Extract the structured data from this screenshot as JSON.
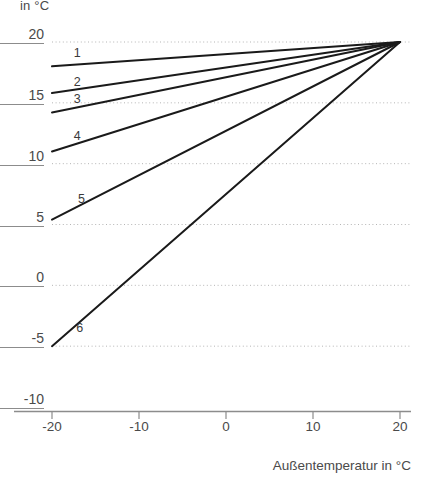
{
  "chart_data": {
    "type": "line",
    "title": "",
    "subtitle": "",
    "xlabel": "Außentemperatur in °C",
    "ylabel": "in °C",
    "xlim": [
      -20,
      20
    ],
    "ylim": [
      -10,
      20
    ],
    "xticks": [
      "-20",
      "-10",
      "0",
      "10",
      "20"
    ],
    "xtick_values": [
      -20,
      -10,
      0,
      10,
      20
    ],
    "yticks": [
      "20",
      "15",
      "10",
      "5",
      "0",
      "-5",
      "-10"
    ],
    "ytick_values": [
      20,
      15,
      10,
      5,
      0,
      -5,
      -10
    ],
    "grid": "horizontal-dotted",
    "gridline_values": [
      20,
      15,
      10,
      5,
      0,
      -5
    ],
    "legend": "inline-curve-numbers",
    "series": [
      {
        "name": "1",
        "x": [
          -20,
          20
        ],
        "values": [
          18.0,
          20.0
        ],
        "label": "1",
        "label_x": -17.5,
        "label_y": 19.0
      },
      {
        "name": "2",
        "x": [
          -20,
          20
        ],
        "values": [
          15.8,
          20.0
        ],
        "label": "2",
        "label_x": -17.5,
        "label_y": 16.6
      },
      {
        "name": "3",
        "x": [
          -20,
          20
        ],
        "values": [
          14.2,
          20.0
        ],
        "label": "3",
        "label_x": -17.5,
        "label_y": 15.2
      },
      {
        "name": "4",
        "x": [
          -20,
          20
        ],
        "values": [
          11.0,
          20.0
        ],
        "label": "4",
        "label_x": -17.5,
        "label_y": 12.2
      },
      {
        "name": "5",
        "x": [
          -20,
          20
        ],
        "values": [
          5.4,
          20.0
        ],
        "label": "5",
        "label_x": -17.0,
        "label_y": 7.0
      },
      {
        "name": "6",
        "x": [
          -20,
          20
        ],
        "values": [
          -5.0,
          20.0
        ],
        "label": "6",
        "label_x": -17.2,
        "label_y": -3.6
      }
    ],
    "colors": {
      "line": "#1a1a1a",
      "axis": "#8c8c8c",
      "grid": "#b5b5b5",
      "text": "#4a4a4a"
    }
  }
}
